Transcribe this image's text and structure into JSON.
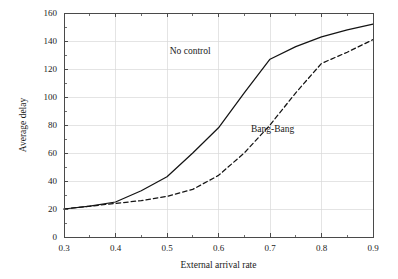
{
  "chart_data": {
    "type": "line",
    "title": "",
    "xlabel": "External arrival rate",
    "ylabel": "Average delay",
    "xlim": [
      0.3,
      0.9
    ],
    "ylim": [
      0,
      160
    ],
    "xticks": [
      0.3,
      0.4,
      0.5,
      0.6,
      0.7,
      0.8,
      0.9
    ],
    "xtick_labels": [
      "0.3",
      "0.4",
      "0.5",
      "0.6",
      "0.7",
      "0.8",
      "0.9"
    ],
    "xticks_minor": [
      0.35,
      0.45,
      0.55,
      0.65,
      0.75,
      0.85
    ],
    "yticks": [
      0,
      20,
      40,
      60,
      80,
      100,
      120,
      140,
      160
    ],
    "ytick_labels": [
      "0",
      "20",
      "40",
      "60",
      "80",
      "100",
      "120",
      "140",
      "160"
    ],
    "yticks_minor": [
      10,
      30,
      50,
      70,
      90,
      110,
      130,
      150
    ],
    "grid": true,
    "grid_color": "#d8d8d8",
    "legend_position": "inline-annotations",
    "series": [
      {
        "name": "No control",
        "style": "solid",
        "color": "#141414",
        "x": [
          0.3,
          0.35,
          0.4,
          0.45,
          0.5,
          0.55,
          0.6,
          0.65,
          0.7,
          0.75,
          0.8,
          0.85,
          0.9
        ],
        "values": [
          20,
          22,
          25,
          33,
          43,
          60,
          78,
          103,
          127,
          136,
          143,
          148,
          152
        ],
        "annotation": {
          "label": "No control",
          "x": 0.545,
          "y": 131
        }
      },
      {
        "name": "Bang-Bang",
        "style": "dashed",
        "color": "#141414",
        "x": [
          0.3,
          0.35,
          0.4,
          0.45,
          0.5,
          0.55,
          0.6,
          0.65,
          0.7,
          0.75,
          0.8,
          0.85,
          0.9
        ],
        "values": [
          20,
          22,
          24,
          26,
          29,
          34,
          44,
          60,
          80,
          103,
          124,
          132,
          141
        ],
        "annotation": {
          "label": "Bang-Bang",
          "x": 0.705,
          "y": 75
        }
      }
    ]
  }
}
